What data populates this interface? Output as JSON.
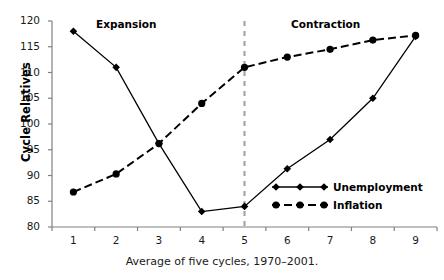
{
  "caption": "Average of five cycles, 1970–2001.",
  "annotations": {
    "expansion": "Expansion",
    "contraction": "Contraction"
  },
  "legend": {
    "position": "inside-bottom-right",
    "entries": [
      {
        "label": "Unemployment",
        "marker": "diamond",
        "line": "solid"
      },
      {
        "label": "Inflation",
        "marker": "circle",
        "line": "dashed"
      }
    ]
  },
  "colors": {
    "series": "#000000",
    "axis": "#808080",
    "divider": "#a6a6a6",
    "text": "#1a1a1a",
    "background": "#ffffff"
  },
  "chart_data": {
    "type": "line",
    "title": "",
    "subtitle": "",
    "xlabel": "",
    "ylabel": "Cycle Relatives",
    "x": [
      1,
      2,
      3,
      4,
      5,
      6,
      7,
      8,
      9
    ],
    "xticklabels": [
      "1",
      "2",
      "3",
      "4",
      "5",
      "6",
      "7",
      "8",
      "9"
    ],
    "yticklabels": [
      "80",
      "85",
      "90",
      "95",
      "100",
      "105",
      "110",
      "115",
      "120"
    ],
    "yticks": [
      80,
      85,
      90,
      95,
      100,
      105,
      110,
      115,
      120
    ],
    "ylim": [
      80,
      120
    ],
    "grid": false,
    "legend_position": "inside-bottom-right",
    "series": [
      {
        "name": "Unemployment",
        "marker": "diamond",
        "line": "solid",
        "values": [
          118,
          111,
          96.2,
          83,
          84,
          91.3,
          97,
          105,
          117
        ]
      },
      {
        "name": "Inflation",
        "marker": "circle",
        "line": "dashed",
        "values": [
          86.8,
          90.3,
          96.2,
          104,
          111,
          113,
          114.5,
          116.3,
          117.2
        ]
      }
    ],
    "annotations": [
      {
        "text": "Expansion",
        "x": 2.1,
        "y": 119
      },
      {
        "text": "Contraction",
        "x": 6.9,
        "y": 119
      }
    ],
    "vertical_divider": {
      "x": 5,
      "style": "dashed",
      "color": "#a6a6a6"
    }
  }
}
